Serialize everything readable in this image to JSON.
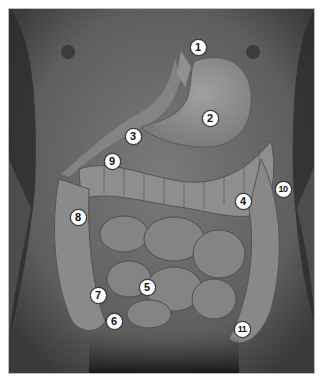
{
  "figure": {
    "colors": {
      "background": "#ffffff",
      "skin": "#6a6a6a",
      "skin_dark": "#3a3a3a",
      "organ_light": "#9a9a9a",
      "organ_mid": "#838383",
      "label_bg": "#ffffff",
      "label_text": "#111111"
    },
    "labels": [
      {
        "id": "1",
        "text": "1",
        "x": 197,
        "y": 46
      },
      {
        "id": "2",
        "text": "2",
        "x": 209,
        "y": 117
      },
      {
        "id": "3",
        "text": "3",
        "x": 132,
        "y": 135
      },
      {
        "id": "4",
        "text": "4",
        "x": 242,
        "y": 200
      },
      {
        "id": "5",
        "text": "5",
        "x": 146,
        "y": 286
      },
      {
        "id": "6",
        "text": "6",
        "x": 113,
        "y": 320
      },
      {
        "id": "7",
        "text": "7",
        "x": 97,
        "y": 294
      },
      {
        "id": "8",
        "text": "8",
        "x": 77,
        "y": 216
      },
      {
        "id": "9",
        "text": "9",
        "x": 111,
        "y": 160
      },
      {
        "id": "10",
        "text": "10",
        "x": 282,
        "y": 188
      },
      {
        "id": "11",
        "text": "11",
        "x": 241,
        "y": 328
      }
    ]
  }
}
